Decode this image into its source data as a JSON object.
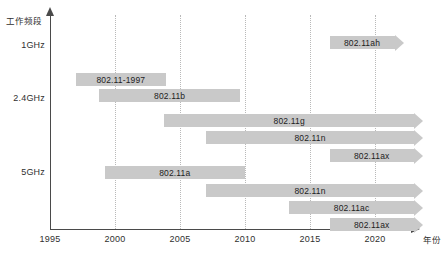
{
  "chart_data": {
    "type": "bar",
    "subtype": "horizontal-timeline-gantt",
    "title": "",
    "xlabel": "年份",
    "ylabel": "工作频段",
    "xlim": [
      1995,
      2023
    ],
    "x_ticks": [
      1995,
      2000,
      2005,
      2010,
      2015,
      2020
    ],
    "x_tick_labels": [
      "1995",
      "2000",
      "2005",
      "2010",
      "2015",
      "2020"
    ],
    "grid": "vertical-dotted",
    "legend": "none",
    "y_categories": [
      "1GHz",
      "2.4GHz",
      "5GHz"
    ],
    "bar_color": "#c9c9c9",
    "axis_color": "#4a4a4a",
    "gridline_color": "#b9b9b9",
    "bars": [
      {
        "label": "802.11ah",
        "band": "1GHz",
        "start": 2016.5,
        "end": 2021.5,
        "open_ended": true,
        "row_top": 36
      },
      {
        "label": "802.11-1997",
        "band": "2.4GHz",
        "start": 1997.0,
        "end": 2003.9,
        "open_ended": false,
        "row_top": 73
      },
      {
        "label": "802.11b",
        "band": "2.4GHz",
        "start": 1998.8,
        "end": 2009.6,
        "open_ended": false,
        "row_top": 89
      },
      {
        "label": "802.11g",
        "band": "2.4GHz",
        "start": 2003.8,
        "end": 2023.0,
        "open_ended": true,
        "row_top": 114
      },
      {
        "label": "802.11n",
        "band": "2.4GHz",
        "start": 2007.0,
        "end": 2023.0,
        "open_ended": true,
        "row_top": 131
      },
      {
        "label": "802.11ax",
        "band": "2.4GHz",
        "start": 2016.5,
        "end": 2023.0,
        "open_ended": true,
        "row_top": 149
      },
      {
        "label": "802.11a",
        "band": "5GHz",
        "start": 1999.2,
        "end": 2010.0,
        "open_ended": false,
        "row_top": 166
      },
      {
        "label": "802.11n",
        "band": "5GHz",
        "start": 2007.0,
        "end": 2023.0,
        "open_ended": true,
        "row_top": 184
      },
      {
        "label": "802.11ac",
        "band": "5GHz",
        "start": 2013.4,
        "end": 2023.0,
        "open_ended": true,
        "row_top": 201
      },
      {
        "label": "802.11ax",
        "band": "5GHz",
        "start": 2016.5,
        "end": 2023.0,
        "open_ended": true,
        "row_top": 218
      }
    ],
    "y_label_positions": [
      {
        "label": "1GHz",
        "top": 40
      },
      {
        "label": "2.4GHz",
        "top": 93
      },
      {
        "label": "5GHz",
        "top": 167
      }
    ]
  }
}
